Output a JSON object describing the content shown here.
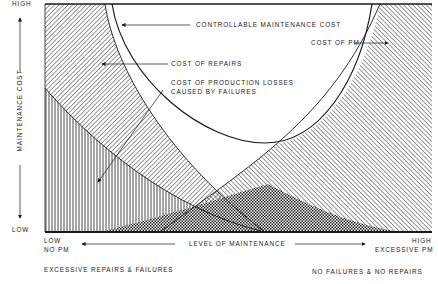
{
  "diagram": {
    "type": "maintenance-cost-tradeoff",
    "y_axis": {
      "label": "MAINTENANCE COST",
      "high": "HIGH",
      "low": "LOW"
    },
    "x_axis": {
      "label": "LEVEL OF MAINTENANCE",
      "left_line1": "LOW",
      "left_line2": "NO PM",
      "right_line1": "HIGH",
      "right_line2": "EXCESSIVE PM"
    },
    "regions": {
      "controllable": "CONTROLLABLE MAINTENANCE COST",
      "pm": "COST OF PM",
      "repairs": "COST OF REPAIRS",
      "production_line1": "COST OF PRODUCTION LOSSES",
      "production_line2": "CAUSED BY FAILURES"
    },
    "footer": {
      "left": "EXCESSIVE REPAIRS & FAILURES",
      "right": "NO FAILURES & NO REPAIRS"
    },
    "colors": {
      "ink": "#1a1a1a",
      "background": "#ffffff"
    }
  }
}
